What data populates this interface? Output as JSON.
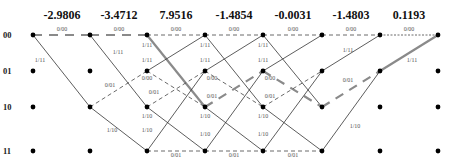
{
  "diagram": {
    "type": "trellis",
    "states": [
      "00",
      "01",
      "10",
      "11"
    ],
    "columns_x": [
      33,
      90,
      147,
      205,
      263,
      322,
      380,
      438
    ],
    "rows_y": [
      35,
      71,
      107,
      151
    ],
    "branch_metrics": [
      {
        "label": "-2.9806",
        "x": 62
      },
      {
        "label": "-3.4712",
        "x": 119
      },
      {
        "label": "7.9516",
        "x": 176
      },
      {
        "label": "-1.4854",
        "x": 234
      },
      {
        "label": "-0.0031",
        "x": 293
      },
      {
        "label": "-1.4803",
        "x": 351
      },
      {
        "label": "0.1193",
        "x": 409
      }
    ],
    "colors": {
      "line": "#333333",
      "dashed": "#444444",
      "survivor": "#8a8a8a",
      "node": "#000000",
      "edge_label": "#555555"
    },
    "edges": [
      {
        "from": [
          0,
          0
        ],
        "to": [
          1,
          0
        ],
        "style": "survivor-dash",
        "label": "0/00",
        "lx": 62,
        "ly": 31
      },
      {
        "from": [
          0,
          0
        ],
        "to": [
          1,
          2
        ],
        "style": "solid",
        "label": "1/11",
        "lx": 40,
        "ly": 62
      },
      {
        "from": [
          1,
          0
        ],
        "to": [
          2,
          0
        ],
        "style": "survivor-dash",
        "label": "0/00",
        "lx": 119,
        "ly": 31
      },
      {
        "from": [
          1,
          0
        ],
        "to": [
          2,
          2
        ],
        "style": "solid",
        "label": "1/11",
        "lx": 118,
        "ly": 54
      },
      {
        "from": [
          1,
          2
        ],
        "to": [
          2,
          1
        ],
        "style": "dashed",
        "label": "0/01",
        "lx": 110,
        "ly": 87
      },
      {
        "from": [
          1,
          2
        ],
        "to": [
          2,
          3
        ],
        "style": "solid",
        "label": "1/10",
        "lx": 112,
        "ly": 132
      },
      {
        "from": [
          2,
          0
        ],
        "to": [
          3,
          0
        ],
        "style": "dashed",
        "label": "0/00",
        "lx": 176,
        "ly": 31
      },
      {
        "from": [
          2,
          0
        ],
        "to": [
          3,
          2
        ],
        "style": "survivor",
        "label": "1/11",
        "lx": 147,
        "ly": 47
      },
      {
        "from": [
          2,
          1
        ],
        "to": [
          3,
          0
        ],
        "style": "solid",
        "label": "1/11",
        "lx": 147,
        "ly": 62
      },
      {
        "from": [
          2,
          1
        ],
        "to": [
          3,
          2
        ],
        "style": "dashed",
        "label": "0/00",
        "lx": 147,
        "ly": 80
      },
      {
        "from": [
          2,
          2
        ],
        "to": [
          3,
          1
        ],
        "style": "dashed",
        "label": "0/01",
        "lx": 154,
        "ly": 94
      },
      {
        "from": [
          2,
          2
        ],
        "to": [
          3,
          3
        ],
        "style": "solid",
        "label": "1/10",
        "lx": 147,
        "ly": 118
      },
      {
        "from": [
          2,
          3
        ],
        "to": [
          3,
          1
        ],
        "style": "solid",
        "label": "1/10",
        "lx": 147,
        "ly": 132
      },
      {
        "from": [
          2,
          3
        ],
        "to": [
          3,
          3
        ],
        "style": "dashed",
        "label": "0/01",
        "lx": 176,
        "ly": 157
      },
      {
        "from": [
          3,
          0
        ],
        "to": [
          4,
          0
        ],
        "style": "dashed",
        "label": "0/00",
        "lx": 234,
        "ly": 31
      },
      {
        "from": [
          3,
          0
        ],
        "to": [
          4,
          2
        ],
        "style": "solid",
        "label": "1/11",
        "lx": 205,
        "ly": 47
      },
      {
        "from": [
          3,
          1
        ],
        "to": [
          4,
          0
        ],
        "style": "solid",
        "label": "1/11",
        "lx": 205,
        "ly": 62
      },
      {
        "from": [
          3,
          1
        ],
        "to": [
          4,
          2
        ],
        "style": "dashed",
        "label": "0/00",
        "lx": 212,
        "ly": 80
      },
      {
        "from": [
          3,
          2
        ],
        "to": [
          4,
          1
        ],
        "style": "survivor-dash",
        "label": "0/01",
        "lx": 212,
        "ly": 98
      },
      {
        "from": [
          3,
          2
        ],
        "to": [
          4,
          3
        ],
        "style": "solid",
        "label": "1/10",
        "lx": 205,
        "ly": 118
      },
      {
        "from": [
          3,
          3
        ],
        "to": [
          4,
          1
        ],
        "style": "solid",
        "label": "1/10",
        "lx": 205,
        "ly": 136
      },
      {
        "from": [
          3,
          3
        ],
        "to": [
          4,
          3
        ],
        "style": "dashed",
        "label": "0/01",
        "lx": 234,
        "ly": 157
      },
      {
        "from": [
          4,
          0
        ],
        "to": [
          5,
          0
        ],
        "style": "dashed",
        "label": "0/00",
        "lx": 293,
        "ly": 31
      },
      {
        "from": [
          4,
          0
        ],
        "to": [
          5,
          2
        ],
        "style": "solid",
        "label": "1/11",
        "lx": 263,
        "ly": 47
      },
      {
        "from": [
          4,
          1
        ],
        "to": [
          5,
          0
        ],
        "style": "solid",
        "label": "1/11",
        "lx": 263,
        "ly": 62
      },
      {
        "from": [
          4,
          1
        ],
        "to": [
          5,
          2
        ],
        "style": "survivor-dash",
        "label": "0/00",
        "lx": 270,
        "ly": 80
      },
      {
        "from": [
          4,
          2
        ],
        "to": [
          5,
          1
        ],
        "style": "dashed",
        "label": "0/01",
        "lx": 270,
        "ly": 98
      },
      {
        "from": [
          4,
          2
        ],
        "to": [
          5,
          3
        ],
        "style": "solid",
        "label": "1/10",
        "lx": 263,
        "ly": 118
      },
      {
        "from": [
          4,
          3
        ],
        "to": [
          5,
          1
        ],
        "style": "solid",
        "label": "1/10",
        "lx": 263,
        "ly": 136
      },
      {
        "from": [
          4,
          3
        ],
        "to": [
          5,
          3
        ],
        "style": "dashed",
        "label": "0/01",
        "lx": 293,
        "ly": 157
      },
      {
        "from": [
          5,
          0
        ],
        "to": [
          6,
          0
        ],
        "style": "dashed",
        "label": "0/00",
        "lx": 351,
        "ly": 31
      },
      {
        "from": [
          5,
          1
        ],
        "to": [
          6,
          0
        ],
        "style": "solid",
        "label": "1/11",
        "lx": 348,
        "ly": 52
      },
      {
        "from": [
          5,
          2
        ],
        "to": [
          6,
          1
        ],
        "style": "survivor-dash",
        "label": "0/01",
        "lx": 348,
        "ly": 82
      },
      {
        "from": [
          5,
          3
        ],
        "to": [
          6,
          1
        ],
        "style": "solid",
        "label": "1/10",
        "lx": 355,
        "ly": 128
      },
      {
        "from": [
          6,
          0
        ],
        "to": [
          7,
          0
        ],
        "style": "dotted",
        "label": "0/00",
        "lx": 409,
        "ly": 31
      },
      {
        "from": [
          6,
          1
        ],
        "to": [
          7,
          0
        ],
        "style": "survivor",
        "label": "1/11",
        "lx": 412,
        "ly": 62
      }
    ]
  }
}
